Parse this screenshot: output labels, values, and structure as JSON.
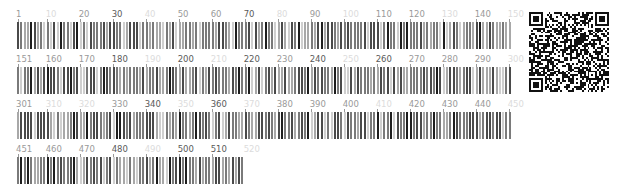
{
  "sequence": {
    "length": 519,
    "positions_per_row": 150,
    "residues": "MKTAYIAKQRQISFVKSHFSRQLEERLGLIEVQAPILSRVGDGTQDNLSGAEKAVQVKVKALPDAQFEVVHSLAKWKRQTLGQHDFSAGEGLYTHMKALRPDEDRLSPLHSVYVDQWDWERVMGDGERQFSTLKSTVEAIWAGIKATEAAVSEEFGLAPFLPDQIHFVHSQELLSRYPDLDAKGRERAIAKDLGAVFLVGIGGKLSDGHRHDVRAPDYDDWSTPSELGHAGLNGDILVWNPVLEDAFELSSMGIRVDADTLKHQLALTGDEDRLELEWHQALLRGEMPQTIGGGIGQSRLTMLLLQLPHIGQVQAGVWPAACRPLEGKPQFYLRLAERDHMLAQQVAEAFRRADYLEIRSEIQTLERAGHKTALIRHRTLCDRIADMDYQALPQEQLMDSLVVTLHQREFSREWSHEEFYEHLGRDFVRATDFLKEVPIHAEPLRMLSEKEWRYDAGVRYEFRPVVLWGSNHVLELSRLSKNASRGSRVLNEYGTQCDLYEFRRGLGEKTPLAEAMAPERLLALAEGLLRKRVEEGTPHETSFAG",
    "shade_map": {
      "dark": "#1e1e1e",
      "medium_dark": "#4a4a4a",
      "medium": "#7a7a7a",
      "light": "#a8a8a8",
      "very_light": "#cfcfcf"
    }
  },
  "rows": [
    {
      "start": 1,
      "end": 150,
      "labels": [
        {
          "text": "1",
          "pos": 1,
          "tone": "mid"
        },
        {
          "text": "10",
          "pos": 10,
          "tone": "faint"
        },
        {
          "text": "20",
          "pos": 20,
          "tone": "mid"
        },
        {
          "text": "30",
          "pos": 30,
          "tone": "dark"
        },
        {
          "text": "40",
          "pos": 40,
          "tone": "faint"
        },
        {
          "text": "50",
          "pos": 50,
          "tone": "mid"
        },
        {
          "text": "60",
          "pos": 60,
          "tone": "mid"
        },
        {
          "text": "70",
          "pos": 70,
          "tone": "dark"
        },
        {
          "text": "80",
          "pos": 80,
          "tone": "faint"
        },
        {
          "text": "90",
          "pos": 90,
          "tone": "mid"
        },
        {
          "text": "100",
          "pos": 100,
          "tone": "faint"
        },
        {
          "text": "110",
          "pos": 110,
          "tone": "mid"
        },
        {
          "text": "120",
          "pos": 120,
          "tone": "mid"
        },
        {
          "text": "130",
          "pos": 130,
          "tone": "faint"
        },
        {
          "text": "140",
          "pos": 140,
          "tone": "mid"
        },
        {
          "text": "150",
          "pos": 150,
          "tone": "faint"
        }
      ]
    },
    {
      "start": 151,
      "end": 300,
      "labels": [
        {
          "text": "151",
          "pos": 151,
          "tone": "mid"
        },
        {
          "text": "160",
          "pos": 160,
          "tone": "mid"
        },
        {
          "text": "170",
          "pos": 170,
          "tone": "mid"
        },
        {
          "text": "180",
          "pos": 180,
          "tone": "dark"
        },
        {
          "text": "190",
          "pos": 190,
          "tone": "faint"
        },
        {
          "text": "200",
          "pos": 200,
          "tone": "dark"
        },
        {
          "text": "210",
          "pos": 210,
          "tone": "faint"
        },
        {
          "text": "220",
          "pos": 220,
          "tone": "dark"
        },
        {
          "text": "230",
          "pos": 230,
          "tone": "mid"
        },
        {
          "text": "240",
          "pos": 240,
          "tone": "dark"
        },
        {
          "text": "250",
          "pos": 250,
          "tone": "faint"
        },
        {
          "text": "260",
          "pos": 260,
          "tone": "dark"
        },
        {
          "text": "270",
          "pos": 270,
          "tone": "mid"
        },
        {
          "text": "280",
          "pos": 280,
          "tone": "mid"
        },
        {
          "text": "290",
          "pos": 290,
          "tone": "mid"
        },
        {
          "text": "300",
          "pos": 300,
          "tone": "faint"
        }
      ]
    },
    {
      "start": 301,
      "end": 450,
      "labels": [
        {
          "text": "301",
          "pos": 301,
          "tone": "mid"
        },
        {
          "text": "310",
          "pos": 310,
          "tone": "faint"
        },
        {
          "text": "320",
          "pos": 320,
          "tone": "faint"
        },
        {
          "text": "330",
          "pos": 330,
          "tone": "mid"
        },
        {
          "text": "340",
          "pos": 340,
          "tone": "dark"
        },
        {
          "text": "350",
          "pos": 350,
          "tone": "faint"
        },
        {
          "text": "360",
          "pos": 360,
          "tone": "dark"
        },
        {
          "text": "370",
          "pos": 370,
          "tone": "faint"
        },
        {
          "text": "380",
          "pos": 380,
          "tone": "mid"
        },
        {
          "text": "390",
          "pos": 390,
          "tone": "mid"
        },
        {
          "text": "400",
          "pos": 400,
          "tone": "mid"
        },
        {
          "text": "410",
          "pos": 410,
          "tone": "faint"
        },
        {
          "text": "420",
          "pos": 420,
          "tone": "mid"
        },
        {
          "text": "430",
          "pos": 430,
          "tone": "mid"
        },
        {
          "text": "440",
          "pos": 440,
          "tone": "mid"
        },
        {
          "text": "450",
          "pos": 450,
          "tone": "faint"
        }
      ]
    },
    {
      "start": 451,
      "end": 519,
      "labels": [
        {
          "text": "451",
          "pos": 451,
          "tone": "mid"
        },
        {
          "text": "460",
          "pos": 460,
          "tone": "mid"
        },
        {
          "text": "470",
          "pos": 470,
          "tone": "mid"
        },
        {
          "text": "480",
          "pos": 480,
          "tone": "dark"
        },
        {
          "text": "490",
          "pos": 490,
          "tone": "faint"
        },
        {
          "text": "500",
          "pos": 500,
          "tone": "dark"
        },
        {
          "text": "510",
          "pos": 510,
          "tone": "dark"
        },
        {
          "text": "520",
          "pos": 520,
          "tone": "faint"
        }
      ]
    }
  ],
  "label_tones": {
    "dark": "#5a5a5a",
    "mid": "#9a9a9a",
    "faint": "#dcdcdc"
  },
  "qr_code": {
    "icon": "qr-code-icon",
    "modules": 41,
    "seed": 7919
  }
}
